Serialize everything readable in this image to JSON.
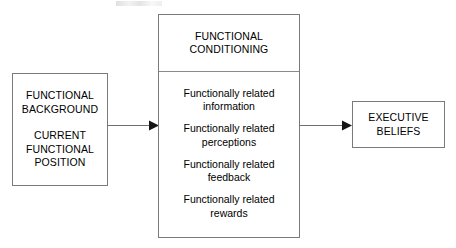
{
  "diagram": {
    "type": "flow-diagram",
    "background_color": "#ffffff",
    "line_color": "#7a7a7a",
    "text_color": "#000000",
    "top_artifact": {
      "present": true,
      "description": "faint illegible clipped caption fragment at top edge"
    },
    "boxes": {
      "functional_background": {
        "name": "FUNCTIONAL BACKGROUND / CURRENT FUNCTIONAL POSITION",
        "lines_group_1": [
          "FUNCTIONAL",
          "BACKGROUND"
        ],
        "lines_group_2": [
          "CURRENT",
          "FUNCTIONAL",
          "POSITION"
        ]
      },
      "functional_conditioning": {
        "header_lines": [
          "FUNCTIONAL",
          "CONDITIONING"
        ],
        "items": [
          "Functionally related\ninformation",
          "Functionally related\nperceptions",
          "Functionally related\nfeedback",
          "Functionally related\nrewards"
        ]
      },
      "executive_beliefs": {
        "lines": [
          "EXECUTIVE",
          "BELIEFS"
        ]
      }
    },
    "arrows": [
      {
        "id": "background-to-conditioning",
        "from": "functional_background",
        "to": "functional_conditioning",
        "direction": "right"
      },
      {
        "id": "conditioning-to-beliefs",
        "from": "functional_conditioning",
        "to": "executive_beliefs",
        "direction": "right"
      }
    ]
  }
}
